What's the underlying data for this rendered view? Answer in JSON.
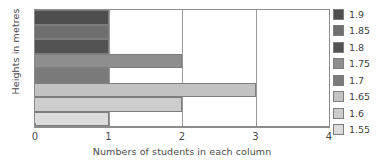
{
  "chart_data": {
    "type": "bar",
    "orientation": "horizontal",
    "title": "",
    "xlabel": "Numbers of students in each column",
    "ylabel": "Heights in metres",
    "xlim": [
      0,
      4
    ],
    "xticks": [
      "0",
      "1",
      "2",
      "3",
      "4"
    ],
    "grid": true,
    "legend_position": "right",
    "categories": [
      "1.9",
      "1.85",
      "1.8",
      "1.75",
      "1.7",
      "1.65",
      "1.6",
      "1.55"
    ],
    "values": [
      1,
      1,
      1,
      2,
      1,
      3,
      2,
      1
    ],
    "colors": [
      "#4e4e4e",
      "#6f6f6f",
      "#535353",
      "#8e8e8e",
      "#7a7a7a",
      "#c2c2c2",
      "#cdcdcd",
      "#dcdcdc"
    ],
    "legend": [
      {
        "label": "1.9",
        "color": "#4e4e4e"
      },
      {
        "label": "1.85",
        "color": "#6f6f6f"
      },
      {
        "label": "1.8",
        "color": "#535353"
      },
      {
        "label": "1.75",
        "color": "#8e8e8e"
      },
      {
        "label": "1.7",
        "color": "#7a7a7a"
      },
      {
        "label": "1.65",
        "color": "#c2c2c2"
      },
      {
        "label": "1.6",
        "color": "#cdcdcd"
      },
      {
        "label": "1.55",
        "color": "#dcdcdc"
      }
    ]
  }
}
